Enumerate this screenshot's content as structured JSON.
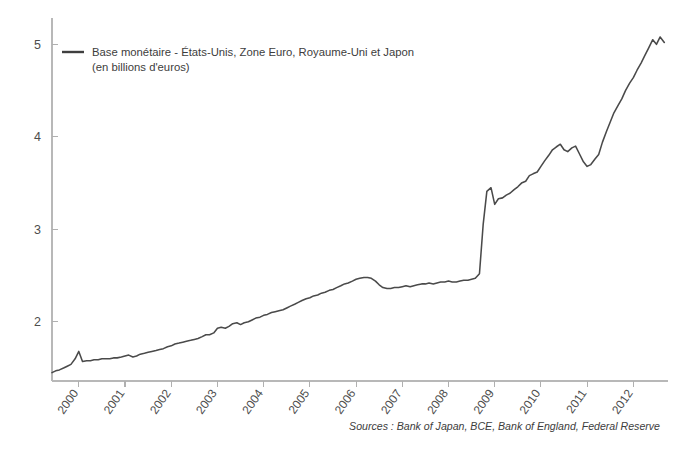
{
  "chart_data": {
    "type": "line",
    "title": "",
    "subtitle": "",
    "xlabel": "",
    "ylabel": "",
    "legend": [
      {
        "name": "Base monétaire - États-Unis, Zone Euro, Royaume-Uni et Japon",
        "unit_line": "(en billions d'euros)",
        "color": "#4a4a4a"
      }
    ],
    "legend_position": "top-left inside axes",
    "grid": false,
    "xlim": [
      1999.42,
      2012.75
    ],
    "ylim": [
      1.36,
      5.22
    ],
    "yticks": [
      2,
      3,
      4,
      5
    ],
    "ytick_labels": [
      "2",
      "3",
      "4",
      "5"
    ],
    "xticks": [
      2000,
      2001,
      2002,
      2003,
      2004,
      2005,
      2006,
      2007,
      2008,
      2009,
      2010,
      2011,
      2012
    ],
    "xtick_labels": [
      "2000",
      "2001",
      "2002",
      "2003",
      "2004",
      "2005",
      "2006",
      "2007",
      "2008",
      "2009",
      "2010",
      "2011",
      "2012"
    ],
    "xtick_rotation": -55,
    "annotations": [
      {
        "text": "Sources : Bank of Japan, BCE, Bank of England, Federal Reserve",
        "position": "bottom-right",
        "style": "italic"
      }
    ],
    "series": [
      {
        "name": "Base monétaire - États-Unis, Zone Euro, Royaume-Uni et Japon",
        "color": "#4a4a4a",
        "x": [
          1999.42,
          1999.5,
          1999.58,
          1999.67,
          1999.75,
          1999.83,
          1999.92,
          2000.0,
          2000.08,
          2000.17,
          2000.25,
          2000.33,
          2000.42,
          2000.5,
          2000.58,
          2000.67,
          2000.75,
          2000.83,
          2000.92,
          2001.0,
          2001.08,
          2001.17,
          2001.25,
          2001.33,
          2001.42,
          2001.5,
          2001.58,
          2001.67,
          2001.75,
          2001.83,
          2001.92,
          2002.0,
          2002.08,
          2002.17,
          2002.25,
          2002.33,
          2002.42,
          2002.5,
          2002.58,
          2002.67,
          2002.75,
          2002.83,
          2002.92,
          2003.0,
          2003.08,
          2003.17,
          2003.25,
          2003.33,
          2003.42,
          2003.5,
          2003.58,
          2003.67,
          2003.75,
          2003.83,
          2003.92,
          2004.0,
          2004.08,
          2004.17,
          2004.25,
          2004.33,
          2004.42,
          2004.5,
          2004.58,
          2004.67,
          2004.75,
          2004.83,
          2004.92,
          2005.0,
          2005.08,
          2005.17,
          2005.25,
          2005.33,
          2005.42,
          2005.5,
          2005.58,
          2005.67,
          2005.75,
          2005.83,
          2005.92,
          2006.0,
          2006.08,
          2006.17,
          2006.25,
          2006.33,
          2006.42,
          2006.5,
          2006.58,
          2006.67,
          2006.75,
          2006.83,
          2006.92,
          2007.0,
          2007.08,
          2007.17,
          2007.25,
          2007.33,
          2007.42,
          2007.5,
          2007.58,
          2007.67,
          2007.75,
          2007.83,
          2007.92,
          2008.0,
          2008.08,
          2008.17,
          2008.25,
          2008.33,
          2008.42,
          2008.5,
          2008.58,
          2008.67,
          2008.75,
          2008.83,
          2008.92,
          2009.0,
          2009.08,
          2009.17,
          2009.25,
          2009.33,
          2009.42,
          2009.5,
          2009.58,
          2009.67,
          2009.75,
          2009.83,
          2009.92,
          2010.0,
          2010.08,
          2010.17,
          2010.25,
          2010.33,
          2010.42,
          2010.5,
          2010.58,
          2010.67,
          2010.75,
          2010.83,
          2010.92,
          2011.0,
          2011.08,
          2011.17,
          2011.25,
          2011.33,
          2011.42,
          2011.5,
          2011.58,
          2011.67,
          2011.75,
          2011.83,
          2011.92,
          2012.0,
          2012.08,
          2012.17,
          2012.25,
          2012.33,
          2012.42,
          2012.5,
          2012.58,
          2012.67
        ],
        "y": [
          1.45,
          1.47,
          1.48,
          1.5,
          1.52,
          1.54,
          1.6,
          1.68,
          1.57,
          1.58,
          1.58,
          1.59,
          1.59,
          1.6,
          1.6,
          1.6,
          1.61,
          1.61,
          1.62,
          1.63,
          1.64,
          1.62,
          1.63,
          1.65,
          1.66,
          1.67,
          1.68,
          1.69,
          1.7,
          1.71,
          1.73,
          1.74,
          1.76,
          1.77,
          1.78,
          1.79,
          1.8,
          1.81,
          1.82,
          1.84,
          1.86,
          1.86,
          1.88,
          1.93,
          1.94,
          1.93,
          1.95,
          1.98,
          1.99,
          1.97,
          1.99,
          2.0,
          2.02,
          2.04,
          2.05,
          2.07,
          2.08,
          2.1,
          2.11,
          2.12,
          2.13,
          2.15,
          2.17,
          2.19,
          2.21,
          2.23,
          2.25,
          2.26,
          2.28,
          2.29,
          2.31,
          2.32,
          2.34,
          2.35,
          2.37,
          2.39,
          2.41,
          2.42,
          2.44,
          2.46,
          2.47,
          2.48,
          2.48,
          2.47,
          2.44,
          2.4,
          2.37,
          2.36,
          2.36,
          2.37,
          2.37,
          2.38,
          2.39,
          2.38,
          2.39,
          2.4,
          2.41,
          2.41,
          2.42,
          2.41,
          2.42,
          2.43,
          2.43,
          2.44,
          2.43,
          2.43,
          2.44,
          2.45,
          2.45,
          2.46,
          2.47,
          2.52,
          3.05,
          3.41,
          3.45,
          3.27,
          3.33,
          3.34,
          3.37,
          3.39,
          3.43,
          3.46,
          3.5,
          3.52,
          3.58,
          3.6,
          3.62,
          3.68,
          3.74,
          3.8,
          3.86,
          3.89,
          3.92,
          3.86,
          3.84,
          3.88,
          3.9,
          3.82,
          3.73,
          3.68,
          3.7,
          3.76,
          3.81,
          3.94,
          4.06,
          4.16,
          4.26,
          4.34,
          4.41,
          4.5,
          4.58,
          4.64,
          4.72,
          4.8,
          4.88,
          4.96,
          5.05,
          5.0,
          5.08,
          5.02
        ]
      }
    ]
  },
  "ylabels": [
    "5",
    "4",
    "3",
    "2"
  ],
  "xlabels": [
    "2000",
    "2001",
    "2002",
    "2003",
    "2004",
    "2005",
    "2006",
    "2007",
    "2008",
    "2009",
    "2010",
    "2011",
    "2012"
  ],
  "legend": {
    "line1": "Base monétaire - États-Unis, Zone Euro, Royaume-Uni et Japon",
    "line2": "(en billions d'euros)"
  },
  "source": "Sources : Bank of Japan, BCE, Bank of England, Federal Reserve"
}
